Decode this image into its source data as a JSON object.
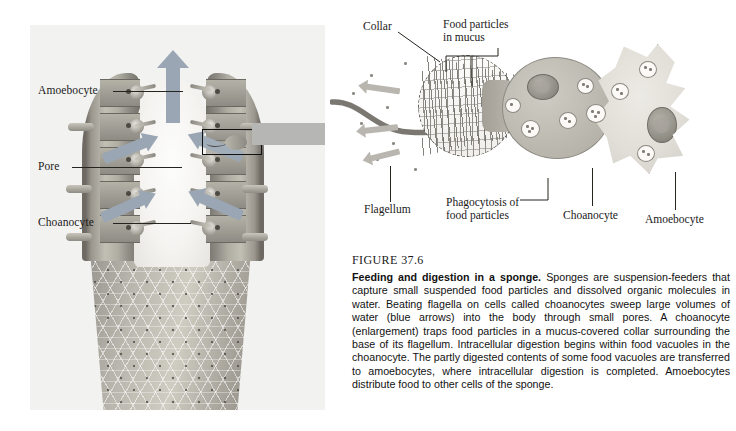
{
  "figure": {
    "number_label": "FIGURE 37.6",
    "title": "Feeding and digestion in a sponge.",
    "caption": "Sponges are suspension-feeders that capture small suspended food particles and dissolved organic molecules in water. Beating flagella on cells called choanocytes sweep large volumes of water (blue arrows) into the body through small pores. A choanocyte (enlargement) traps food particles in a mucus-covered collar surrounding the base of its flagellum. Intracellular digestion begins within food vacuoles in the choanocyte. The partly digested contents of some food vacuoles are transferred to amoebocytes, where intracellular digestion is completed. Amoebocytes distribute food to other cells of the sponge."
  },
  "left_panel": {
    "name": "sponge-cross-section",
    "labels": [
      {
        "text": "Amoebocyte",
        "target": "amoebocyte-in-wall"
      },
      {
        "text": "Pore",
        "target": "pore-canal"
      },
      {
        "text": "Choanocyte",
        "target": "choanocyte-in-wall"
      }
    ],
    "annotations": {
      "osculum_arrow": "water-out",
      "intake_arrows": "water-in",
      "callout": "choanocyte-enlargement-region"
    }
  },
  "right_panel": {
    "name": "choanocyte-enlargement",
    "labels": [
      {
        "text": "Collar",
        "position": "top-left"
      },
      {
        "text": "Food particles\nin mucus",
        "line1": "Food particles",
        "line2": "in mucus",
        "position": "top-center"
      },
      {
        "text": "Flagellum",
        "position": "bottom-left"
      },
      {
        "text": "Phagocytosis of\nfood particles",
        "line1": "Phagocytosis of",
        "line2": "food particles",
        "position": "bottom-center"
      },
      {
        "text": "Choanocyte",
        "position": "bottom-right-center"
      },
      {
        "text": "Amoebocyte",
        "position": "bottom-right"
      }
    ]
  },
  "colors": {
    "water_arrow": "#9aa6b4",
    "transition_arrow": "#b6b6b4",
    "panel_background": "#f2f2f1",
    "sponge_wall": "#a8a49b",
    "choanocyte_fill": "#c0bdb4",
    "amoebocyte_fill": "#e1dfd8",
    "text": "#1a1a1a"
  }
}
